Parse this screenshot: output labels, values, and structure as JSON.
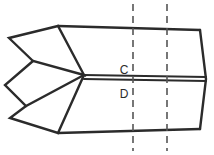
{
  "figure": {
    "background_color": "#ffffff",
    "stroke_color": "#2b2b2b",
    "dashed_stroke_color": "#555555",
    "width": 214,
    "height": 155,
    "labels": [
      {
        "id": "label-c",
        "text": "C",
        "x": 124,
        "y": 74,
        "position": "above-centerline"
      },
      {
        "id": "label-d",
        "text": "D",
        "x": 124,
        "y": 98,
        "position": "below-centerline"
      }
    ],
    "section_lines": [
      {
        "id": "section-line-left",
        "x": 133,
        "y_start": 4,
        "y_end": 151,
        "style": "dashed"
      },
      {
        "id": "section-line-right",
        "x": 167,
        "y_start": 4,
        "y_end": 151,
        "style": "dashed"
      }
    ],
    "shapes": {
      "fletching_upper": "9,38 58,26 84,75 33,61",
      "fletching_middle": "5,85 33,61 84,75 26,106",
      "fletching_lower": "10,118 26,106 84,75 58,133",
      "top_edge": "58,26 200,30",
      "bottom_edge": "58,133 200,129",
      "right_edge": "200,30 206,79 200,129",
      "shaft_top": "84,75 206,77",
      "shaft_bottom": "84,79 206,81"
    }
  }
}
